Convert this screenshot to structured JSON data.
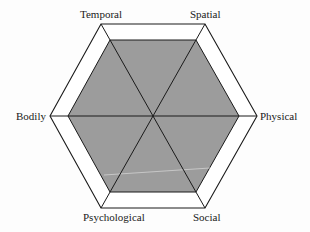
{
  "diagram": {
    "type": "hexagonal radar / spider diagram",
    "axes": [
      "Temporal",
      "Spatial",
      "Physical",
      "Social",
      "Psychological",
      "Bodily"
    ],
    "labels": {
      "temporal": "Temporal",
      "spatial": "Spatial",
      "physical": "Physical",
      "social": "Social",
      "psychological": "Psychological",
      "bodily": "Bodily"
    },
    "outer_hexagon": {
      "stroke": "#1a1a1a",
      "fill": "#ffffff"
    },
    "inner_hexagon": {
      "stroke": "#1a1a1a",
      "fill": "#9c9c9c",
      "relative_size": 0.83
    },
    "spokes": 3
  }
}
